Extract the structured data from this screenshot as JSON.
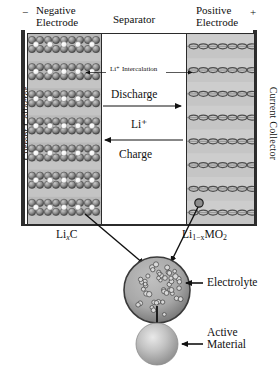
{
  "diagram": {
    "terminals": {
      "negative_symbol": "−",
      "positive_symbol": "+"
    },
    "headers": {
      "negative_electrode": "Negative\nElectrode",
      "negative_electrode_line1": "Negative",
      "negative_electrode_line2": "Electrode",
      "separator": "Separator",
      "positive_electrode_line1": "Positive",
      "positive_electrode_line2": "Electrode"
    },
    "collectors": {
      "left": "Current Collector",
      "right": "Current Collector"
    },
    "center_labels": {
      "intercalation": "Li⁺ Intercalation",
      "discharge": "Discharge",
      "li_ion": "Li⁺",
      "charge": "Charge"
    },
    "chemistry": {
      "anode_formula_pre": "Li",
      "anode_formula_sub": "x",
      "anode_formula_post": "C",
      "cathode_formula_pre": "Li",
      "cathode_formula_sub": "1−x",
      "cathode_formula_post": "MO",
      "cathode_formula_sub2": "2"
    },
    "callouts": {
      "electrolyte": "Electrolyte",
      "active_material_line1": "Active",
      "active_material_line2": "Material"
    },
    "colors": {
      "collector": "#2e2e2e",
      "negative_electrode_bg": "#b9b9b9",
      "positive_electrode_bg": "#c5c5c5",
      "separator_bg": "#ffffff",
      "particle_fill": "#9a9a9a",
      "li_ion_fill": "#ffffff",
      "outline": "#2b2b2b",
      "arrow": "#111111",
      "page_bg": "#ffffff"
    },
    "structure": {
      "negative_electrode_layers": 7,
      "positive_electrode_chain_rows": 8,
      "electrolyte_particle_count": 46
    }
  }
}
